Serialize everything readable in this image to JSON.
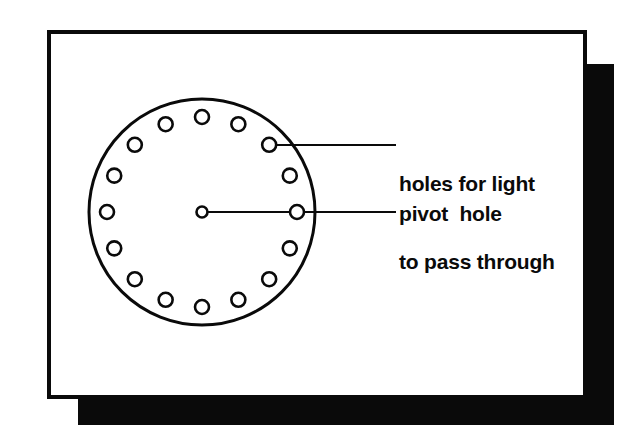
{
  "figure": {
    "name": "spinning-disc-diagram"
  },
  "frame": {
    "border_color": "#0a0a0a",
    "background_color": "#ffffff",
    "shadow_color": "#0a0a0a"
  },
  "labels": {
    "holes_line1": "holes for light",
    "holes_line2": "to pass through",
    "pivot": "pivot  hole"
  },
  "diagram_data": {
    "type": "technical-line-drawing",
    "stroke_color": "#0a0a0a",
    "fill_color": "#ffffff",
    "disc": {
      "center_x": 202,
      "center_y": 212,
      "radius": 113,
      "stroke_width": 3
    },
    "hole_ring": {
      "count": 16,
      "ring_radius": 95,
      "hole_radius": 7,
      "stroke_width": 2.6,
      "start_angle_deg": -90,
      "step_deg": 22.5
    },
    "pivot_hole": {
      "center_x": 202,
      "center_y": 212,
      "radius": 5.5,
      "stroke_width": 2.6
    },
    "leaders": [
      {
        "name": "holes-leader",
        "from_x": 276,
        "from_y": 145,
        "to_x": 396,
        "to_y": 145,
        "stroke_width": 2
      },
      {
        "name": "pivot-leader",
        "from_x": 202,
        "from_y": 212,
        "to_x": 396,
        "to_y": 212,
        "stroke_width": 2
      }
    ]
  }
}
